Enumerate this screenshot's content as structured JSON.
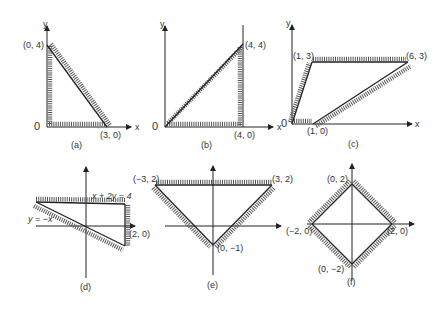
{
  "figure": {
    "panels": [
      {
        "id": "a",
        "caption": "(a)",
        "axis_x_label": "x",
        "axis_y_label": "y",
        "origin_label": "0",
        "vertices": [
          {
            "label": "(0, 4)",
            "x": 0,
            "y": 4
          },
          {
            "label": "(3, 0)",
            "x": 3,
            "y": 0
          }
        ],
        "region": "triangle bounded by x=0, y=0 and line through (0,4),(3,0)"
      },
      {
        "id": "b",
        "caption": "(b)",
        "axis_x_label": "x",
        "axis_y_label": "y",
        "origin_label": "0",
        "vertices": [
          {
            "label": "(4, 4)",
            "x": 4,
            "y": 4
          },
          {
            "label": "(4, 0)",
            "x": 4,
            "y": 0
          }
        ],
        "region": "triangle bounded by y=x, x=4, y=0"
      },
      {
        "id": "c",
        "caption": "(c)",
        "axis_x_label": "x",
        "axis_y_label": "y",
        "origin_label": "0",
        "vertices": [
          {
            "label": "(1, 3)",
            "x": 1,
            "y": 3
          },
          {
            "label": "(6, 3)",
            "x": 6,
            "y": 3
          },
          {
            "label": "(1, 0)",
            "x": 1,
            "y": 0
          }
        ],
        "region": "parallelogram with vertices (0,0),(1,0),(6,3),(1,3)"
      },
      {
        "id": "d",
        "caption": "(d)",
        "line_labels": [
          "x + 2y = 4",
          "y = −x"
        ],
        "vertices": [
          {
            "label": "(2, 0)",
            "x": 2,
            "y": 0
          }
        ],
        "region": "triangle bounded by x+2y=4, y=-x and x=2"
      },
      {
        "id": "e",
        "caption": "(e)",
        "vertices": [
          {
            "label": "(−3, 2)",
            "x": -3,
            "y": 2
          },
          {
            "label": "(3, 2)",
            "x": 3,
            "y": 2
          },
          {
            "label": "(0, −1)",
            "x": 0,
            "y": -1
          }
        ],
        "region": "inverted triangle"
      },
      {
        "id": "f",
        "caption": "(f)",
        "vertices": [
          {
            "label": "(0, 2)",
            "x": 0,
            "y": 2
          },
          {
            "label": "(−2, 0)",
            "x": -2,
            "y": 0
          },
          {
            "label": "(2, 0)",
            "x": 2,
            "y": 0
          },
          {
            "label": "(0, −2)",
            "x": 0,
            "y": -2
          }
        ],
        "region": "diamond |x|+|y|<=2"
      }
    ]
  }
}
